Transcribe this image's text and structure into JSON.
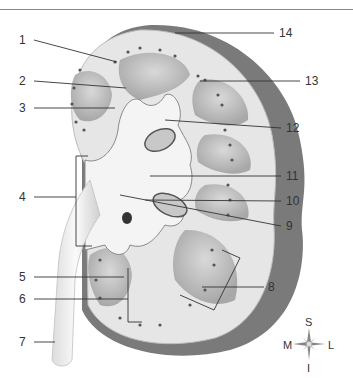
{
  "figure": {
    "type": "anatomical-diagram",
    "labels": [
      {
        "num": "1",
        "x": 24,
        "y": 40
      },
      {
        "num": "2",
        "x": 24,
        "y": 81
      },
      {
        "num": "3",
        "x": 24,
        "y": 108
      },
      {
        "num": "4",
        "x": 24,
        "y": 197
      },
      {
        "num": "5",
        "x": 24,
        "y": 277
      },
      {
        "num": "6",
        "x": 24,
        "y": 299
      },
      {
        "num": "7",
        "x": 24,
        "y": 341
      },
      {
        "num": "8",
        "x": 268,
        "y": 287
      },
      {
        "num": "9",
        "x": 286,
        "y": 226
      },
      {
        "num": "10",
        "x": 286,
        "y": 201
      },
      {
        "num": "11",
        "x": 286,
        "y": 176
      },
      {
        "num": "12",
        "x": 286,
        "y": 128
      },
      {
        "num": "13",
        "x": 306,
        "y": 81
      },
      {
        "num": "14",
        "x": 280,
        "y": 33
      }
    ],
    "compass": {
      "top": "S",
      "left": "M",
      "right": "L",
      "bottom": "I"
    },
    "colors": {
      "capsule": "#7d7d7d",
      "cortex": "#e8e8e8",
      "pyramid": "#bdbdbd",
      "pelvis": "#f4f4f4",
      "line": "#333333"
    }
  }
}
